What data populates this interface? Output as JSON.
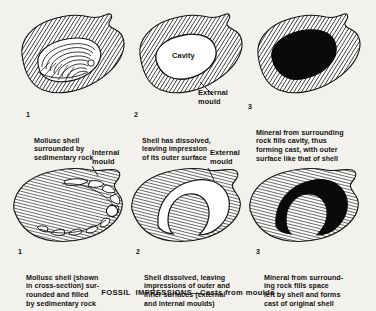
{
  "figure": {
    "title": "FOSSIL  IMPRESSIONS—Casts from moulds",
    "background_color": "#f2f1ee",
    "ink_color": "#15130f"
  },
  "top_row": {
    "panels": [
      {
        "number": "1",
        "caption": "Mollusc shell\nsurrounded by\nsedimentary rock",
        "subject": "mollusc-shell-in-rock",
        "shell_fill": "#ffffff",
        "rock_fill": "hatched"
      },
      {
        "number": "2",
        "caption": "Shell has dissolved,\nleaving impression\nof its outer surface",
        "subject": "cavity-external-mould",
        "inner_label": "Cavity",
        "leader_label": "External\nmould",
        "shell_fill": "#ffffff",
        "rock_fill": "hatched"
      },
      {
        "number": "3",
        "caption": "Mineral from surrounding\nrock fills cavity, thus\nforming cast, with outer\nsurface like that of shell",
        "subject": "mineral-cast-solid",
        "shell_fill": "#000000",
        "rock_fill": "hatched"
      }
    ]
  },
  "bottom_row": {
    "panels": [
      {
        "number": "1",
        "caption": "Mollusc shell (shown\nin cross-section) sur-\nrounded and filled\nby sedimentary rock",
        "subject": "shell-cross-section",
        "leader_label": "Internal\nmould"
      },
      {
        "number": "2",
        "caption": "Shell dissolved, leaving\nimpressions of outer and\ninner surfaces (external\nand internal moulds)",
        "subject": "void-crescent-moulds",
        "leader_label": "External\nmould"
      },
      {
        "number": "3",
        "caption": "Mineral from surround-\ning rock fills space\nleft by shell and forms\ncast of original shell",
        "subject": "black-crescent-cast"
      }
    ]
  }
}
